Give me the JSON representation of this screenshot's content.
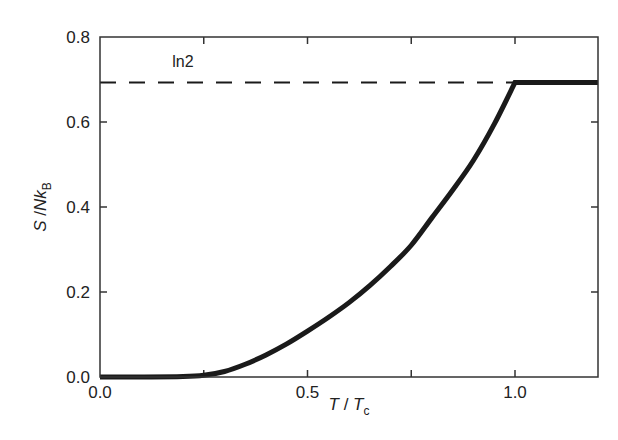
{
  "chart_data": {
    "type": "line",
    "title": "",
    "xlabel": "T / T_c",
    "xlabel_parts": {
      "main1": "T",
      "sep": " / ",
      "main2": "T",
      "sub": "c"
    },
    "ylabel": "S / N k_B",
    "ylabel_parts": {
      "main1": "S",
      "sep": " /",
      "main2": "Nk",
      "sub": "B"
    },
    "xlim": [
      0.0,
      1.2
    ],
    "ylim": [
      0.0,
      0.8
    ],
    "xticks": [
      0.0,
      0.5,
      1.0
    ],
    "xtick_labels": [
      "0.0",
      "0.5",
      "1.0"
    ],
    "xticks_minor": [
      0.25,
      0.75
    ],
    "yticks": [
      0.0,
      0.2,
      0.4,
      0.6,
      0.8
    ],
    "ytick_labels": [
      "0.0",
      "0.2",
      "0.4",
      "0.6",
      "0.8"
    ],
    "grid": false,
    "legend": null,
    "series": [
      {
        "name": "entropy",
        "style": "solid-thick",
        "color": "#1a1a1a",
        "x": [
          0.0,
          0.1,
          0.2,
          0.25,
          0.3,
          0.35,
          0.4,
          0.45,
          0.5,
          0.55,
          0.6,
          0.65,
          0.7,
          0.75,
          0.8,
          0.85,
          0.9,
          0.95,
          1.0,
          1.2
        ],
        "y": [
          0.0,
          0.0,
          0.001,
          0.004,
          0.013,
          0.03,
          0.052,
          0.078,
          0.108,
          0.14,
          0.175,
          0.215,
          0.26,
          0.31,
          0.375,
          0.44,
          0.51,
          0.595,
          0.693,
          0.693
        ]
      },
      {
        "name": "ln2 reference",
        "style": "dashed",
        "color": "#1a1a1a",
        "x": [
          0.0,
          1.2
        ],
        "y": [
          0.693,
          0.693
        ]
      }
    ],
    "annotations": [
      {
        "text": "ln2",
        "x": 0.2,
        "y": 0.73
      }
    ]
  }
}
